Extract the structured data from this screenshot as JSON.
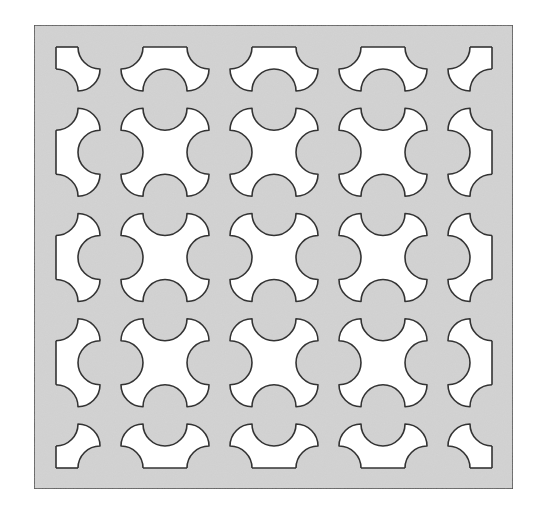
{
  "figure": {
    "canvas": {
      "width": 541,
      "height": 520,
      "background": "#ffffff"
    },
    "panel": {
      "x": 34,
      "y": 25,
      "width": 479,
      "height": 464,
      "fill": "#d4d4d4",
      "stroke": "#3a3a3a",
      "stroke_width": 1.5
    },
    "clip_region": {
      "x": 56,
      "y": 47,
      "width": 436,
      "height": 421
    },
    "cutout": {
      "shape": "cross-with-notched-edges-and-rounded-corners",
      "half_size": 44,
      "arc_radius": 22,
      "fill": "#ffffff",
      "stroke": "#333333",
      "stroke_width": 1.6
    },
    "grid": {
      "columns": 5,
      "rows": 5,
      "x_centers": [
        56,
        165,
        274,
        383,
        492
      ],
      "y_centers": [
        47,
        152.25,
        257.5,
        362.75,
        468
      ]
    }
  }
}
